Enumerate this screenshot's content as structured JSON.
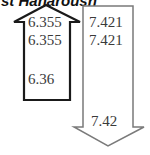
{
  "header": {
    "title_partial": "st Hanaroush"
  },
  "up_arrow": {
    "direction": "up",
    "stroke_color": "#1a1a1a",
    "values": [
      "6.355",
      "6.355",
      "6.36"
    ]
  },
  "down_arrow": {
    "direction": "down",
    "stroke_color": "#7a7a7a",
    "values": [
      "7.421",
      "7.421",
      "7.42"
    ]
  }
}
